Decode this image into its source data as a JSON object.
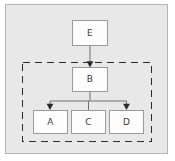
{
  "figure": {
    "kind": "block-diagram",
    "canvas": {
      "background_color": "#e8e8e8",
      "border_color": "#b3b3b3"
    },
    "nodes": [
      {
        "id": "E",
        "label": "E",
        "role": "top-node",
        "inside_dashed_group": false
      },
      {
        "id": "B",
        "label": "B",
        "role": "parent-node",
        "inside_dashed_group": true
      },
      {
        "id": "A",
        "label": "A",
        "role": "child-node",
        "inside_dashed_group": true
      },
      {
        "id": "C",
        "label": "C",
        "role": "child-node",
        "inside_dashed_group": true
      },
      {
        "id": "D",
        "label": "D",
        "role": "child-node",
        "inside_dashed_group": true
      }
    ],
    "edges": [
      {
        "from": "E",
        "to": "B",
        "arrowhead": true
      },
      {
        "from": "B",
        "to": "A",
        "arrowhead": true
      },
      {
        "from": "B",
        "to": "C",
        "arrowhead": false
      },
      {
        "from": "B",
        "to": "D",
        "arrowhead": true
      }
    ],
    "group": {
      "name": "dashed-group",
      "style": "dashed",
      "members": [
        "B",
        "A",
        "C",
        "D"
      ],
      "stroke_color": "#2b2b2b"
    },
    "colors": {
      "node_fill": "#fdfdfd",
      "node_stroke": "#9a9a9a",
      "edge_stroke": "#6f6f6f",
      "label_text": "#3b3b3b"
    }
  }
}
